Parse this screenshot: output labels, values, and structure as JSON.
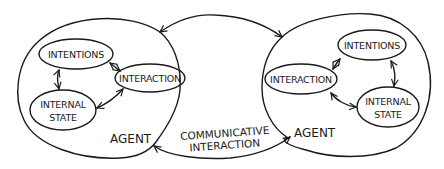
{
  "diagram": {
    "agents": [
      {
        "label": "AGENT",
        "components": {
          "intentions": "INTENTIONS",
          "interaction": "INTERACTION",
          "internal_state_line1": "INTERNAL",
          "internal_state_line2": "STATE"
        }
      },
      {
        "label": "AGENT",
        "components": {
          "intentions": "INTENTIONS",
          "interaction": "INTERACTION",
          "internal_state_line1": "INTERNAL",
          "internal_state_line2": "STATE"
        }
      }
    ],
    "link": {
      "line1": "COMMUNICATIVE",
      "line2": "INTERACTION"
    }
  }
}
